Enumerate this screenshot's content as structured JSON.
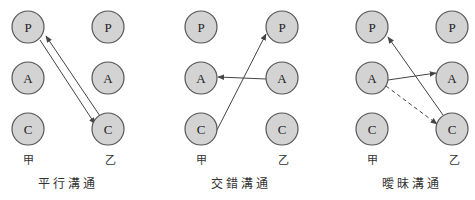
{
  "diagrams": [
    {
      "caption": "平行溝通",
      "left_party": "甲",
      "right_party": "乙",
      "left_nodes": [
        "P",
        "A",
        "C"
      ],
      "right_nodes": [
        "P",
        "A",
        "C"
      ],
      "edges": [
        {
          "from": "甲.P",
          "to": "乙.C",
          "style": "solid"
        },
        {
          "from": "乙.C",
          "to": "甲.P",
          "style": "solid"
        }
      ]
    },
    {
      "caption": "交錯溝通",
      "left_party": "甲",
      "right_party": "乙",
      "left_nodes": [
        "P",
        "A",
        "C"
      ],
      "right_nodes": [
        "P",
        "A",
        "C"
      ],
      "edges": [
        {
          "from": "甲.C",
          "to": "乙.P",
          "style": "solid"
        },
        {
          "from": "乙.A",
          "to": "甲.A",
          "style": "solid"
        }
      ]
    },
    {
      "caption": "曖昧溝通",
      "left_party": "甲",
      "right_party": "乙",
      "left_nodes": [
        "P",
        "A",
        "C"
      ],
      "right_nodes": [
        "P",
        "A",
        "C"
      ],
      "edges": [
        {
          "from": "甲.A",
          "to": "乙.A",
          "style": "solid"
        },
        {
          "from": "甲.A",
          "to": "乙.C",
          "style": "dashed"
        },
        {
          "from": "乙.C",
          "to": "甲.P",
          "style": "solid"
        }
      ]
    }
  ]
}
